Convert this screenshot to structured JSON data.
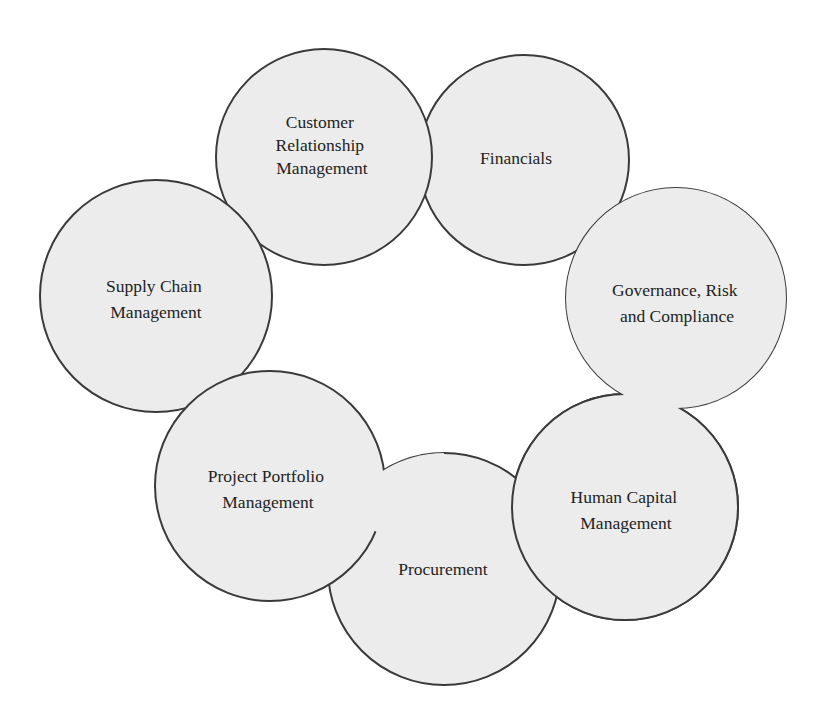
{
  "diagram": {
    "type": "cyclic-overlapping-circles",
    "colors": {
      "circle_fill": "#ececec",
      "circle_stroke": "#3a3a3a",
      "text": "#232323",
      "background": "#ffffff"
    },
    "nodes": [
      {
        "id": "crm",
        "lines": [
          "Customer",
          "Relationship",
          "Management"
        ],
        "label": "Customer Relationship Management",
        "cx": 324,
        "cy": 157,
        "r": 108
      },
      {
        "id": "financials",
        "lines": [
          "Financials"
        ],
        "label": "Financials",
        "cx": 524,
        "cy": 160,
        "r": 105
      },
      {
        "id": "grc",
        "lines": [
          "Governance, Risk",
          "and Compliance"
        ],
        "label": "Governance, Risk and Compliance",
        "cx": 676,
        "cy": 298,
        "r": 110
      },
      {
        "id": "hcm",
        "lines": [
          "Human Capital",
          "Management"
        ],
        "label": "Human Capital Management",
        "cx": 625,
        "cy": 507,
        "r": 113
      },
      {
        "id": "procurement",
        "lines": [
          "Procurement"
        ],
        "label": "Procurement",
        "cx": 444,
        "cy": 569,
        "r": 116
      },
      {
        "id": "ppm",
        "lines": [
          "Project Portfolio",
          "Management"
        ],
        "label": "Project Portfolio Management",
        "cx": 270,
        "cy": 486,
        "r": 115
      },
      {
        "id": "scm",
        "lines": [
          "Supply Chain",
          "Management"
        ],
        "label": "Supply Chain Management",
        "cx": 156,
        "cy": 296,
        "r": 116
      }
    ]
  }
}
